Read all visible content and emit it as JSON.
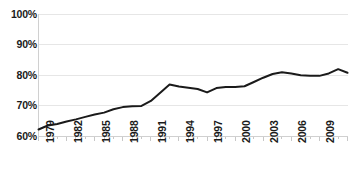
{
  "chart_data": {
    "type": "line",
    "title": "",
    "subtitle": "",
    "xlabel": "",
    "ylabel": "",
    "ylim": [
      60,
      100
    ],
    "ytick_values": [
      60,
      70,
      80,
      90,
      100
    ],
    "ytick_labels": [
      "60%",
      "70%",
      "80%",
      "90%",
      "100%"
    ],
    "grid": true,
    "grid_axis": "y",
    "legend": false,
    "legend_position": "none",
    "x": [
      1979,
      1980,
      1981,
      1982,
      1983,
      1984,
      1985,
      1986,
      1987,
      1988,
      1989,
      1990,
      1991,
      1992,
      1993,
      1994,
      1995,
      1996,
      1997,
      1998,
      1999,
      2000,
      2001,
      2002,
      2003,
      2004,
      2005,
      2006,
      2007,
      2008,
      2009,
      2010,
      2011,
      2012
    ],
    "xtick_labels": [
      "1979",
      "1982",
      "1985",
      "1988",
      "1991",
      "1994",
      "1997",
      "2000",
      "2003",
      "2006",
      "2009",
      "2012"
    ],
    "xtick_interval": 3,
    "xlim": [
      1979,
      2012
    ],
    "values": [
      62.3,
      63.6,
      64.1,
      64.9,
      65.6,
      66.4,
      67.2,
      67.8,
      68.9,
      69.6,
      69.9,
      70.0,
      71.6,
      74.3,
      77.0,
      76.3,
      75.9,
      75.5,
      74.4,
      75.8,
      76.2,
      76.2,
      76.4,
      77.8,
      79.2,
      80.4,
      81.0,
      80.6,
      80.0,
      79.8,
      79.8,
      80.6,
      82.0,
      80.8
    ],
    "series": [
      {
        "name": "series-1",
        "color": "#1a1a1a",
        "line_width": 2,
        "marker": "none",
        "values": [
          62.3,
          63.6,
          64.1,
          64.9,
          65.6,
          66.4,
          67.2,
          67.8,
          68.9,
          69.6,
          69.9,
          70.0,
          71.6,
          74.3,
          77.0,
          76.3,
          75.9,
          75.5,
          74.4,
          75.8,
          76.2,
          76.2,
          76.4,
          77.8,
          79.2,
          80.4,
          81.0,
          80.6,
          80.0,
          79.8,
          79.8,
          80.6,
          82.0,
          80.8
        ]
      }
    ]
  },
  "colors": {
    "line": "#1a1a1a",
    "gridline": "#e6e6e6",
    "axis": "#d0d0d0",
    "tick": "#c8c8c8",
    "text": "#1a1a1a",
    "background": "#ffffff"
  }
}
